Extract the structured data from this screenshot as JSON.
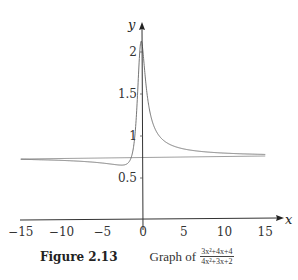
{
  "chart_data": {
    "type": "line",
    "function": "(3x^2+4x+4)/(4x^2+3x+2)",
    "xlabel": "x",
    "ylabel": "y",
    "xlim": [
      -15,
      15
    ],
    "ylim": [
      0,
      2.2
    ],
    "xticks": [
      -15,
      -10,
      -5,
      0,
      5,
      10,
      15
    ],
    "xtick_labels": [
      "−15",
      "−10",
      "−5",
      "0",
      "5",
      "10",
      "15"
    ],
    "yticks": [
      0.5,
      1,
      1.5,
      2
    ],
    "ytick_labels": [
      "0.5",
      "1",
      "1.5",
      "2"
    ],
    "grid": false,
    "legend": null,
    "series": [
      {
        "name": "f(x)",
        "x": [
          -15,
          -12,
          -10,
          -8,
          -6,
          -5,
          -4,
          -3,
          -2.5,
          -2,
          -1.5,
          -1.2,
          -1,
          -0.8,
          -0.6,
          -0.4,
          -0.3,
          -0.2,
          0,
          0.25,
          0.5,
          1,
          1.5,
          2,
          3,
          4,
          5,
          6,
          8,
          10,
          12,
          15
        ],
        "y": [
          0.729,
          0.725,
          0.721,
          0.715,
          0.704,
          0.695,
          0.682,
          0.662,
          0.652,
          0.643,
          0.66,
          0.727,
          0.333,
          1.09,
          1.52,
          1.97,
          2.11,
          2.19,
          2.0,
          1.69,
          1.43,
          1.22,
          1.07,
          0.98,
          0.89,
          0.84,
          0.82,
          0.8,
          0.79,
          0.78,
          0.77,
          0.77
        ]
      },
      {
        "name": "horizontal asymptote",
        "x": [
          -15,
          15
        ],
        "y": [
          0.75,
          0.75
        ]
      }
    ],
    "annotations": [
      "horizontal asymptote y = 0.75"
    ]
  },
  "axes": {
    "x_label": "x",
    "y_label": "y"
  },
  "caption": {
    "label": "Figure 2.13",
    "text": "Graph of",
    "numerator": "3x²+4x+4",
    "denominator": "4x²+3x+2"
  },
  "colors": {
    "axis": "#333333",
    "curve": "#666666",
    "asymptote": "#888888"
  }
}
